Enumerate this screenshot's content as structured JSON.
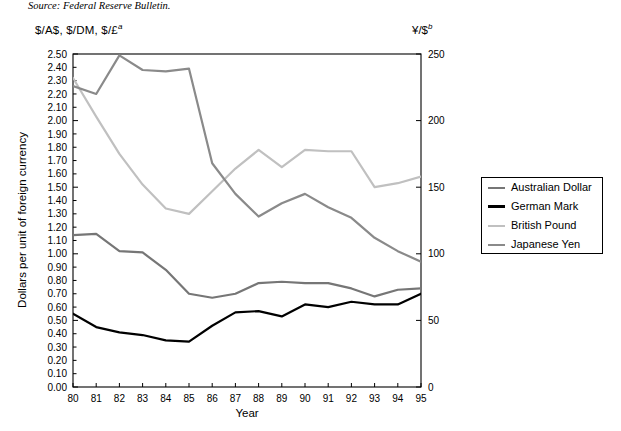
{
  "source_note": "Source: Federal Reserve Bulletin.",
  "left_axis_title": "$/A$, $/DM, $/£",
  "left_axis_title_sup": "a",
  "right_axis_title": "¥/$",
  "right_axis_title_sup": "b",
  "legend": {
    "items": [
      {
        "label": "Australian Dollar",
        "color": "#767676"
      },
      {
        "label": "German Mark",
        "color": "#000000"
      },
      {
        "label": "British Pound",
        "color": "#c0c0c0"
      },
      {
        "label": "Japanese Yen",
        "color": "#8a8a8a"
      }
    ]
  },
  "chart_data": {
    "type": "line",
    "title": "",
    "xlabel": "Year",
    "ylabel": "Dollars per unit of foreign currency",
    "y2label": "¥/$",
    "grid": false,
    "legend_position": "right",
    "x": [
      80,
      81,
      82,
      83,
      84,
      85,
      86,
      87,
      88,
      89,
      90,
      91,
      92,
      93,
      94,
      95
    ],
    "categories": [
      "80",
      "81",
      "82",
      "83",
      "84",
      "85",
      "86",
      "87",
      "88",
      "89",
      "90",
      "91",
      "92",
      "93",
      "94",
      "95"
    ],
    "ylim": [
      0.0,
      2.5
    ],
    "ytick_step": 0.1,
    "yticks": [
      "2.50",
      "2.40",
      "2.30",
      "2.20",
      "2.10",
      "2.00",
      "1.90",
      "1.80",
      "1.70",
      "1.60",
      "1.50",
      "1.40",
      "1.30",
      "1.20",
      "1.10",
      "1.00",
      "0.90",
      "0.80",
      "0.70",
      "0.60",
      "0.50",
      "0.40",
      "0.30",
      "0.20",
      "0.10",
      "0.00"
    ],
    "y2lim": [
      0,
      250
    ],
    "y2ticks": [
      "250",
      "200",
      "150",
      "100",
      "50",
      "0"
    ],
    "series": [
      {
        "name": "Australian Dollar",
        "color": "#767676",
        "axis": "left",
        "values": [
          1.14,
          1.15,
          1.02,
          1.01,
          0.88,
          0.7,
          0.67,
          0.7,
          0.78,
          0.79,
          0.78,
          0.78,
          0.74,
          0.68,
          0.73,
          0.74
        ]
      },
      {
        "name": "German Mark",
        "color": "#000000",
        "axis": "left",
        "values": [
          0.55,
          0.45,
          0.41,
          0.39,
          0.35,
          0.34,
          0.46,
          0.56,
          0.57,
          0.53,
          0.62,
          0.6,
          0.64,
          0.62,
          0.62,
          0.7
        ]
      },
      {
        "name": "British Pound",
        "color": "#c0c0c0",
        "axis": "left",
        "values": [
          2.32,
          2.03,
          1.75,
          1.52,
          1.34,
          1.3,
          1.47,
          1.64,
          1.78,
          1.65,
          1.78,
          1.77,
          1.77,
          1.5,
          1.53,
          1.58
        ]
      },
      {
        "name": "Japanese Yen",
        "color": "#8a8a8a",
        "axis": "right",
        "values": [
          226,
          220,
          249,
          238,
          237,
          239,
          168,
          145,
          128,
          138,
          145,
          135,
          127,
          112,
          102,
          94
        ]
      }
    ]
  }
}
